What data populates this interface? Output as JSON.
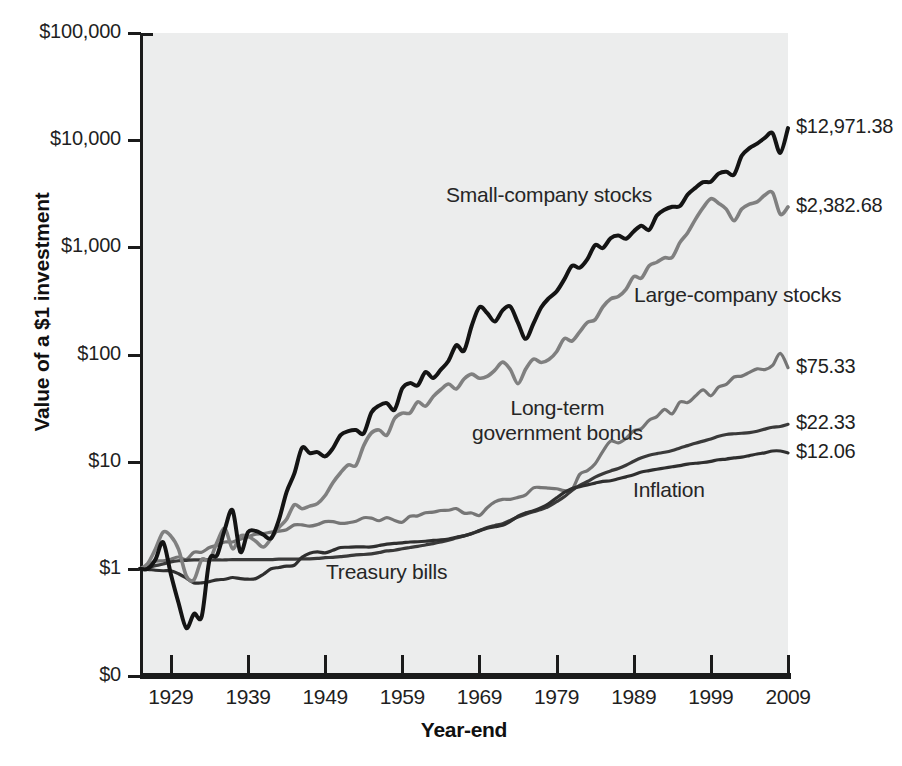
{
  "chart_data": {
    "type": "line",
    "title": "",
    "xlabel": "Year-end",
    "ylabel": "Value of a $1 investment",
    "scale": "log",
    "grid": false,
    "legend_position": "inline-annotations",
    "xlim": [
      1925,
      2009
    ],
    "ylim": [
      0,
      100000
    ],
    "x_tick_labels": [
      "1929",
      "1939",
      "1949",
      "1959",
      "1969",
      "1979",
      "1989",
      "1999",
      "2009"
    ],
    "x_ticks": [
      1929,
      1939,
      1949,
      1959,
      1969,
      1979,
      1989,
      1999,
      2009
    ],
    "y_tick_labels": [
      "$100,000",
      "$10,000",
      "$1,000",
      "$100",
      "$10",
      "$1",
      "$0"
    ],
    "y_ticks": [
      100000,
      10000,
      1000,
      100,
      10,
      1,
      0
    ],
    "series": [
      {
        "name": "Small-company stocks",
        "color": "#141414",
        "width": 4.0,
        "end_label": "$12,971.38",
        "end_value": 12971.38,
        "annotation": "Small-company stocks",
        "x": [
          1925,
          1926,
          1927,
          1928,
          1929,
          1930,
          1931,
          1932,
          1933,
          1934,
          1935,
          1936,
          1937,
          1938,
          1939,
          1940,
          1941,
          1942,
          1943,
          1944,
          1945,
          1946,
          1947,
          1948,
          1949,
          1950,
          1951,
          1952,
          1953,
          1954,
          1955,
          1956,
          1957,
          1958,
          1959,
          1960,
          1961,
          1962,
          1963,
          1964,
          1965,
          1966,
          1967,
          1968,
          1969,
          1970,
          1971,
          1972,
          1973,
          1974,
          1975,
          1976,
          1977,
          1978,
          1979,
          1980,
          1981,
          1982,
          1983,
          1984,
          1985,
          1986,
          1987,
          1988,
          1989,
          1990,
          1991,
          1992,
          1993,
          1994,
          1995,
          1996,
          1997,
          1998,
          1999,
          2000,
          2001,
          2002,
          2003,
          2004,
          2005,
          2006,
          2007,
          2008,
          2009
        ],
        "values": [
          1.0,
          1.0,
          1.22,
          1.77,
          0.89,
          0.48,
          0.28,
          0.38,
          0.36,
          1.2,
          1.34,
          2.35,
          3.52,
          1.44,
          2.2,
          2.25,
          2.08,
          1.93,
          2.86,
          5.21,
          7.73,
          13.46,
          12.04,
          12.27,
          11.19,
          13.31,
          17.71,
          19.26,
          19.72,
          18.36,
          28.72,
          33.31,
          35.12,
          30.55,
          48.37,
          54.09,
          51.56,
          68.41,
          60.42,
          72.19,
          87.5,
          121.98,
          108.38,
          185.61,
          276.02,
          244.01,
          203.31,
          258.1,
          280.89,
          197.0,
          139.9,
          194.19,
          274.32,
          335.68,
          387.52,
          502.44,
          672.06,
          645.32,
          776.24,
          1050.34,
          985.1,
          1215.14,
          1288.79,
          1202.97,
          1406.94,
          1593.55,
          1453.35,
          1980.33,
          2239.75,
          2391.44,
          2428.13,
          3109.39,
          3590.49,
          4054.34,
          4097.44,
          4867.55,
          5082.01,
          4767.27,
          7140.73,
          8417.09,
          9281.56,
          10511.21,
          11604.19,
          7600.18,
          12971.38
        ]
      },
      {
        "name": "Large-company stocks",
        "color": "#808080",
        "width": 3.6,
        "end_label": "$2,382.68",
        "end_value": 2382.68,
        "annotation": "Large-company stocks",
        "x": [
          1925,
          1926,
          1927,
          1928,
          1929,
          1930,
          1931,
          1932,
          1933,
          1934,
          1935,
          1936,
          1937,
          1938,
          1939,
          1940,
          1941,
          1942,
          1943,
          1944,
          1945,
          1946,
          1947,
          1948,
          1949,
          1950,
          1951,
          1952,
          1953,
          1954,
          1955,
          1956,
          1957,
          1958,
          1959,
          1960,
          1961,
          1962,
          1963,
          1964,
          1965,
          1966,
          1967,
          1968,
          1969,
          1970,
          1971,
          1972,
          1973,
          1974,
          1975,
          1976,
          1977,
          1978,
          1979,
          1980,
          1981,
          1982,
          1983,
          1984,
          1985,
          1986,
          1987,
          1988,
          1989,
          1990,
          1991,
          1992,
          1993,
          1994,
          1995,
          1996,
          1997,
          1998,
          1999,
          2000,
          2001,
          2002,
          2003,
          2004,
          2005,
          2006,
          2007,
          2008,
          2009
        ],
        "values": [
          1.0,
          1.12,
          1.53,
          2.2,
          2.02,
          1.52,
          0.86,
          0.79,
          1.22,
          1.2,
          1.78,
          2.38,
          1.54,
          2.02,
          2.01,
          1.81,
          1.6,
          1.92,
          2.42,
          2.9,
          3.96,
          3.64,
          3.85,
          4.06,
          4.83,
          6.36,
          7.89,
          9.34,
          9.25,
          14.11,
          18.56,
          19.78,
          17.65,
          25.3,
          28.34,
          28.48,
          36.11,
          32.95,
          40.47,
          47.14,
          53.02,
          47.67,
          59.1,
          65.6,
          60.05,
          62.46,
          71.38,
          84.95,
          72.5,
          53.31,
          73.15,
          90.62,
          84.14,
          89.67,
          106.21,
          140.62,
          133.72,
          162.4,
          199.05,
          211.57,
          278.55,
          330.39,
          347.68,
          405.19,
          533.48,
          516.86,
          674.17,
          725.62,
          798.64,
          809.07,
          1113.3,
          1368.92,
          1825.38,
          2347.33,
          2841.27,
          2582.04,
          2275.15,
          1772.21,
          2281.32,
          2529.59,
          2653.81,
          3072.39,
          3240.61,
          2041.4,
          2382.68
        ]
      },
      {
        "name": "Long-term government bonds",
        "color": "#767676",
        "width": 3.2,
        "end_label": "$75.33",
        "end_value": 75.33,
        "annotation": "Long-term\ngovernment bonds",
        "x": [
          1925,
          1926,
          1927,
          1928,
          1929,
          1930,
          1931,
          1932,
          1933,
          1934,
          1935,
          1936,
          1937,
          1938,
          1939,
          1940,
          1941,
          1942,
          1943,
          1944,
          1945,
          1946,
          1947,
          1948,
          1949,
          1950,
          1951,
          1952,
          1953,
          1954,
          1955,
          1956,
          1957,
          1958,
          1959,
          1960,
          1961,
          1962,
          1963,
          1964,
          1965,
          1966,
          1967,
          1968,
          1969,
          1970,
          1971,
          1972,
          1973,
          1974,
          1975,
          1976,
          1977,
          1978,
          1979,
          1980,
          1981,
          1982,
          1983,
          1984,
          1985,
          1986,
          1987,
          1988,
          1989,
          1990,
          1991,
          1992,
          1993,
          1994,
          1995,
          1996,
          1997,
          1998,
          1999,
          2000,
          2001,
          2002,
          2003,
          2004,
          2005,
          2006,
          2007,
          2008,
          2009
        ],
        "values": [
          1.0,
          1.08,
          1.18,
          1.19,
          1.23,
          1.29,
          1.22,
          1.43,
          1.43,
          1.58,
          1.66,
          1.78,
          1.78,
          1.89,
          1.99,
          2.11,
          2.13,
          2.2,
          2.25,
          2.32,
          2.57,
          2.57,
          2.5,
          2.59,
          2.76,
          2.76,
          2.66,
          2.69,
          2.78,
          3.0,
          2.97,
          2.81,
          3.01,
          2.83,
          2.72,
          3.09,
          3.12,
          3.34,
          3.38,
          3.5,
          3.52,
          3.65,
          3.31,
          3.32,
          3.15,
          3.72,
          4.22,
          4.45,
          4.45,
          4.64,
          4.9,
          5.7,
          5.73,
          5.66,
          5.59,
          5.37,
          5.49,
          7.61,
          8.25,
          9.58,
          12.49,
          15.54,
          14.99,
          16.46,
          19.34,
          20.35,
          24.34,
          26.34,
          30.78,
          28.01,
          36.03,
          35.6,
          40.93,
          46.8,
          41.18,
          49.69,
          52.55,
          61.67,
          62.83,
          68.11,
          73.53,
          72.33,
          79.1,
          102.33,
          75.33
        ]
      },
      {
        "name": "Treasury bills",
        "color": "#3a3a3a",
        "width": 3.2,
        "end_label": "$22.33",
        "end_value": 22.33,
        "annotation": "Treasury bills",
        "x": [
          1925,
          1926,
          1927,
          1928,
          1929,
          1930,
          1931,
          1932,
          1933,
          1934,
          1935,
          1936,
          1937,
          1938,
          1939,
          1940,
          1941,
          1942,
          1943,
          1944,
          1945,
          1946,
          1947,
          1948,
          1949,
          1950,
          1951,
          1952,
          1953,
          1954,
          1955,
          1956,
          1957,
          1958,
          1959,
          1960,
          1961,
          1962,
          1963,
          1964,
          1965,
          1966,
          1967,
          1968,
          1969,
          1970,
          1971,
          1972,
          1973,
          1974,
          1975,
          1976,
          1977,
          1978,
          1979,
          1980,
          1981,
          1982,
          1983,
          1984,
          1985,
          1986,
          1987,
          1988,
          1989,
          1990,
          1991,
          1992,
          1993,
          1994,
          1995,
          1996,
          1997,
          1998,
          1999,
          2000,
          2001,
          2002,
          2003,
          2004,
          2005,
          2006,
          2007,
          2008,
          2009
        ],
        "values": [
          1.0,
          1.03,
          1.07,
          1.11,
          1.16,
          1.19,
          1.2,
          1.21,
          1.21,
          1.21,
          1.21,
          1.21,
          1.22,
          1.22,
          1.22,
          1.22,
          1.22,
          1.22,
          1.23,
          1.23,
          1.23,
          1.24,
          1.24,
          1.25,
          1.27,
          1.28,
          1.3,
          1.32,
          1.35,
          1.36,
          1.38,
          1.42,
          1.47,
          1.49,
          1.54,
          1.58,
          1.62,
          1.67,
          1.72,
          1.78,
          1.85,
          1.94,
          2.03,
          2.14,
          2.28,
          2.43,
          2.54,
          2.64,
          2.83,
          3.05,
          3.24,
          3.41,
          3.57,
          3.83,
          4.23,
          4.7,
          5.4,
          6.0,
          6.53,
          7.17,
          7.72,
          8.2,
          8.65,
          9.27,
          10.08,
          10.86,
          11.47,
          11.89,
          12.23,
          12.72,
          13.43,
          14.12,
          14.85,
          15.55,
          16.28,
          17.25,
          17.92,
          18.22,
          18.41,
          18.65,
          19.22,
          20.14,
          20.94,
          21.3,
          22.33
        ]
      },
      {
        "name": "Inflation",
        "color": "#2f2f2f",
        "width": 3.2,
        "end_label": "$12.06",
        "end_value": 12.06,
        "annotation": "Inflation",
        "x": [
          1925,
          1926,
          1927,
          1928,
          1929,
          1930,
          1931,
          1932,
          1933,
          1934,
          1935,
          1936,
          1937,
          1938,
          1939,
          1940,
          1941,
          1942,
          1943,
          1944,
          1945,
          1946,
          1947,
          1948,
          1949,
          1950,
          1951,
          1952,
          1953,
          1954,
          1955,
          1956,
          1957,
          1958,
          1959,
          1960,
          1961,
          1962,
          1963,
          1964,
          1965,
          1966,
          1967,
          1968,
          1969,
          1970,
          1971,
          1972,
          1973,
          1974,
          1975,
          1976,
          1977,
          1978,
          1979,
          1980,
          1981,
          1982,
          1983,
          1984,
          1985,
          1986,
          1987,
          1988,
          1989,
          1990,
          1991,
          1992,
          1993,
          1994,
          1995,
          1996,
          1997,
          1998,
          1999,
          2000,
          2001,
          2002,
          2003,
          2004,
          2005,
          2006,
          2007,
          2008,
          2009
        ],
        "values": [
          1.0,
          0.99,
          0.97,
          0.96,
          0.96,
          0.9,
          0.82,
          0.74,
          0.74,
          0.76,
          0.79,
          0.8,
          0.83,
          0.81,
          0.8,
          0.81,
          0.89,
          1.0,
          1.03,
          1.06,
          1.08,
          1.28,
          1.4,
          1.44,
          1.41,
          1.49,
          1.58,
          1.59,
          1.6,
          1.6,
          1.6,
          1.65,
          1.7,
          1.73,
          1.75,
          1.78,
          1.79,
          1.81,
          1.84,
          1.86,
          1.9,
          1.97,
          2.03,
          2.13,
          2.26,
          2.39,
          2.47,
          2.55,
          2.77,
          3.11,
          3.33,
          3.49,
          3.72,
          4.06,
          4.6,
          5.17,
          5.63,
          5.85,
          6.07,
          6.31,
          6.55,
          6.63,
          6.92,
          7.22,
          7.55,
          8.01,
          8.26,
          8.5,
          8.73,
          8.96,
          9.19,
          9.5,
          9.66,
          9.82,
          10.08,
          10.42,
          10.58,
          10.84,
          11.04,
          11.4,
          11.79,
          12.09,
          12.58,
          12.58,
          12.06
        ]
      }
    ]
  },
  "axis": {
    "y_title": "Value of a $1 investment",
    "x_title": "Year-end"
  }
}
